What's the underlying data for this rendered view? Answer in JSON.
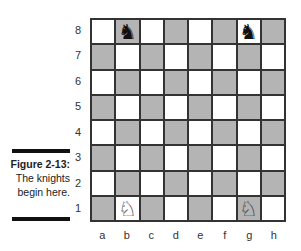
{
  "figure": {
    "title": "Figure 2-13:",
    "caption_lines": [
      "The knights",
      "begin here."
    ]
  },
  "board": {
    "ranks": [
      "8",
      "7",
      "6",
      "5",
      "4",
      "3",
      "2",
      "1"
    ],
    "files": [
      "a",
      "b",
      "c",
      "d",
      "e",
      "f",
      "g",
      "h"
    ],
    "colors": {
      "light": "#ffffff",
      "dark": "#b4b4b4",
      "grid": "#333333"
    },
    "pieces": [
      {
        "square": "b8",
        "piece": "black-knight",
        "glyph": "♞"
      },
      {
        "square": "g8",
        "piece": "black-knight",
        "glyph": "♞"
      },
      {
        "square": "b1",
        "piece": "white-knight",
        "glyph": "♘"
      },
      {
        "square": "g1",
        "piece": "white-knight",
        "glyph": "♘"
      }
    ]
  }
}
